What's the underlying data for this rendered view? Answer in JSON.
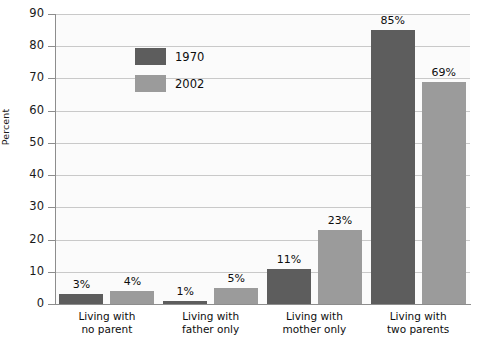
{
  "chart_data": {
    "type": "bar",
    "title": "",
    "xlabel": "",
    "ylabel": "Percent",
    "ylim": [
      0,
      90
    ],
    "ytick_step": 10,
    "yticks": [
      "90",
      "80",
      "70",
      "60",
      "50",
      "40",
      "30",
      "20",
      "10",
      "0"
    ],
    "grid": "horizontal",
    "legend_position": "inside-upper-left",
    "categories": [
      "Living with\nno parent",
      "Living with\nfather only",
      "Living with\nmother only",
      "Living with\ntwo parents"
    ],
    "series": [
      {
        "name": "1970",
        "color": "#5d5d5d",
        "values": [
          3,
          1,
          11,
          85
        ],
        "labels": [
          "3%",
          "1%",
          "11%",
          "85%"
        ]
      },
      {
        "name": "2002",
        "color": "#9b9b9b",
        "values": [
          4,
          5,
          23,
          69
        ],
        "labels": [
          "4%",
          "5%",
          "23%",
          "69%"
        ]
      }
    ]
  },
  "axis": {
    "y_title": "Percent"
  },
  "legend": {
    "items": [
      {
        "label": "1970",
        "color": "#5d5d5d"
      },
      {
        "label": "2002",
        "color": "#9b9b9b"
      }
    ]
  },
  "colors": {
    "series_1970": "#5d5d5d",
    "series_2002": "#9b9b9b",
    "gridline": "#c9c9c9",
    "axis": "#8d8d8d",
    "plot_background": "#fbfbfb",
    "text": "#0d0d0d"
  }
}
